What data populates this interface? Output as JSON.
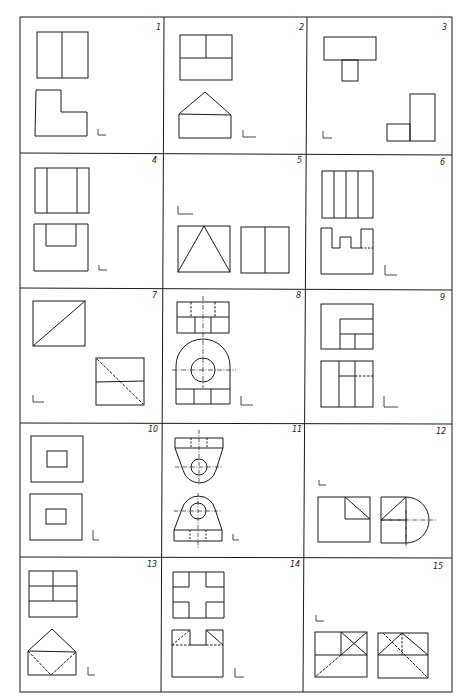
{
  "page": {
    "type": "technical drawing exercise sheet",
    "grid": {
      "rows": 5,
      "columns": 3
    },
    "line_color": "#1a1a1a",
    "background": "#ffffff"
  },
  "cells": [
    {
      "number": "1",
      "figure": "two orthographic views: rectangle split vertically; L-shaped profile"
    },
    {
      "number": "2",
      "figure": "rectangle with T-partition; pentagon (roof) shape"
    },
    {
      "number": "3",
      "figure": "T-shape view; stepped L profile"
    },
    {
      "number": "4",
      "figure": "rectangle with two vertical lines; U-channel profile"
    },
    {
      "number": "5",
      "figure": "rectangle with inscribed triangle; rectangle split vertically"
    },
    {
      "number": "6",
      "figure": "rectangle with four vertical lines; castellated profile with hidden line"
    },
    {
      "number": "7",
      "figure": "rectangle with diagonal; rectangle with hidden diagonal and horizontal split"
    },
    {
      "number": "8",
      "figure": "rectangle with hidden lines and centerline; arched bracket with hole"
    },
    {
      "number": "9",
      "figure": "nested rectangle corner; rectangle with partitions and hidden line"
    },
    {
      "number": "10",
      "figure": "square with inner rectangle; square with inner rectangle"
    },
    {
      "number": "11",
      "figure": "tapered bracket with hole (two views, mirrored)"
    },
    {
      "number": "12",
      "figure": "square with diagonal corner; square with semicircle and diagonal"
    },
    {
      "number": "13",
      "figure": "rectangle grid; pentagon with inscribed hidden V"
    },
    {
      "number": "14",
      "figure": "cross-shaped cutout; notched block with hidden lines"
    },
    {
      "number": "15",
      "figure": "rectangle with X in quadrant; rectangle with X and hidden lines"
    }
  ],
  "axis_marker": "L"
}
